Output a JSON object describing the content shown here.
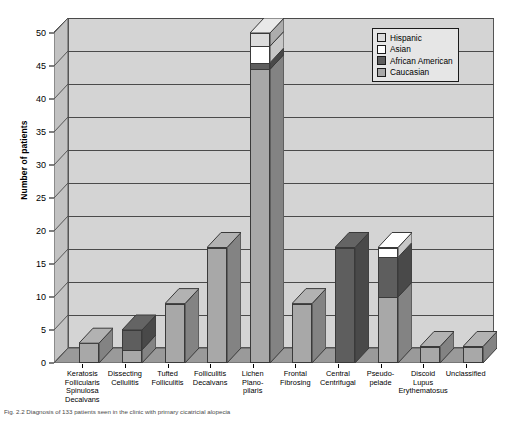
{
  "chart_data": {
    "type": "bar",
    "subtype": "stacked-bar-3d",
    "title": "",
    "xlabel": "",
    "ylabel": "Number of patients",
    "ylim": [
      0,
      50
    ],
    "ytick_step": 5,
    "yticks": [
      0,
      5,
      10,
      15,
      20,
      25,
      30,
      35,
      40,
      45,
      50
    ],
    "grid": true,
    "legend_position": "top-right",
    "categories": [
      "Keratosis Follicularis Spinulosa Decalvans",
      "Dissecting Cellulitis",
      "Tufted Folliculitis",
      "Folliculitis Decalvans",
      "Lichen Plano-pilaris",
      "Frontal Fibrosing",
      "Central Centrifugal",
      "Pseudo-pelade",
      "Discoid Lupus Erythematosus",
      "Unclassified"
    ],
    "series": [
      {
        "name": "Caucasian",
        "color": "#a8a8a8",
        "values": [
          3,
          2,
          9,
          17.5,
          44.5,
          9,
          0,
          10,
          2.5,
          2.5
        ]
      },
      {
        "name": "African American",
        "color": "#5e5e5e",
        "values": [
          0,
          3,
          0,
          0,
          1,
          0,
          17.5,
          6,
          0,
          0
        ]
      },
      {
        "name": "Asian",
        "color": "#ffffff",
        "values": [
          0,
          0,
          0,
          0,
          2.5,
          0,
          0,
          1.5,
          0,
          0
        ]
      },
      {
        "name": "Hispanic",
        "color": "#dcdcdc",
        "values": [
          0,
          0,
          0,
          0,
          2,
          0,
          0,
          0,
          0,
          0
        ]
      }
    ]
  },
  "axis": {
    "ylabel": "Number of patients",
    "tick_labels": [
      "0",
      "5",
      "10",
      "15",
      "20",
      "25",
      "30",
      "35",
      "40",
      "45",
      "50"
    ]
  },
  "legend": {
    "entries": [
      {
        "label": "Hispanic",
        "color": "#dcdcdc"
      },
      {
        "label": "Asian",
        "color": "#ffffff"
      },
      {
        "label": "African American",
        "color": "#5e5e5e"
      },
      {
        "label": "Caucasian",
        "color": "#a8a8a8"
      }
    ]
  },
  "x_axis_labels": [
    [
      "Keratosis",
      "Follicularis",
      "Spinulosa",
      "Decalvans"
    ],
    [
      "Dissecting",
      "Cellulitis"
    ],
    [
      "Tufted",
      "Folliculitis"
    ],
    [
      "Folliculitis",
      "Decalvans"
    ],
    [
      "Lichen",
      "Plano-",
      "pilaris"
    ],
    [
      "Frontal",
      "Fibrosing"
    ],
    [
      "Central",
      "Centrifugal"
    ],
    [
      "Pseudo-",
      "pelade"
    ],
    [
      "Discoid",
      "Lupus",
      "Erythematosus"
    ],
    [
      "Unclassified"
    ]
  ],
  "caption": "Fig. 2.2   Diagnosis of 133 patients seen in the clinic with primary cicatricial alopecia",
  "colors": {
    "plot_background": "#d4d4d4",
    "side_wall": "#bfbfbf",
    "floor": "#9a9a9a",
    "gridline": "#4a4a4a",
    "legend_background": "#e6e6e6"
  }
}
